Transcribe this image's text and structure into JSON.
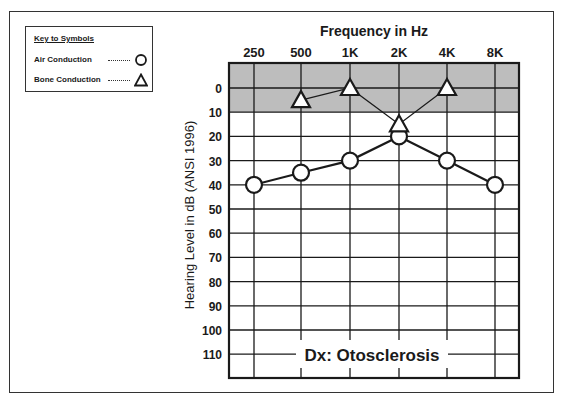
{
  "key": {
    "title": "Key to Symbols",
    "items": [
      {
        "label": "Air Conduction",
        "symbol": "circle"
      },
      {
        "label": "Bone Conduction",
        "symbol": "triangle"
      }
    ]
  },
  "diagnosis": "Dx: Otosclerosis",
  "colors": {
    "shaded_band": "#bdbdbd",
    "grid": "#1a1a1a",
    "background": "#ffffff"
  },
  "chart_data": {
    "type": "line",
    "title": "Frequency in Hz",
    "xlabel": "Frequency in Hz",
    "ylabel": "Hearing Level in dB (ANSI 1996)",
    "categories": [
      "250",
      "500",
      "1K",
      "2K",
      "4K",
      "8K"
    ],
    "y_ticks": [
      0,
      10,
      20,
      30,
      40,
      50,
      60,
      70,
      80,
      90,
      100,
      110
    ],
    "ylim": [
      -10,
      120
    ],
    "y_inverted": true,
    "shaded_region": [
      -10,
      10
    ],
    "series": [
      {
        "name": "Air Conduction",
        "marker": "circle",
        "values": [
          40,
          35,
          30,
          20,
          30,
          40
        ]
      },
      {
        "name": "Bone Conduction",
        "marker": "triangle",
        "values": [
          null,
          5,
          0,
          15,
          0,
          null
        ]
      }
    ],
    "annotation": "Dx: Otosclerosis"
  }
}
